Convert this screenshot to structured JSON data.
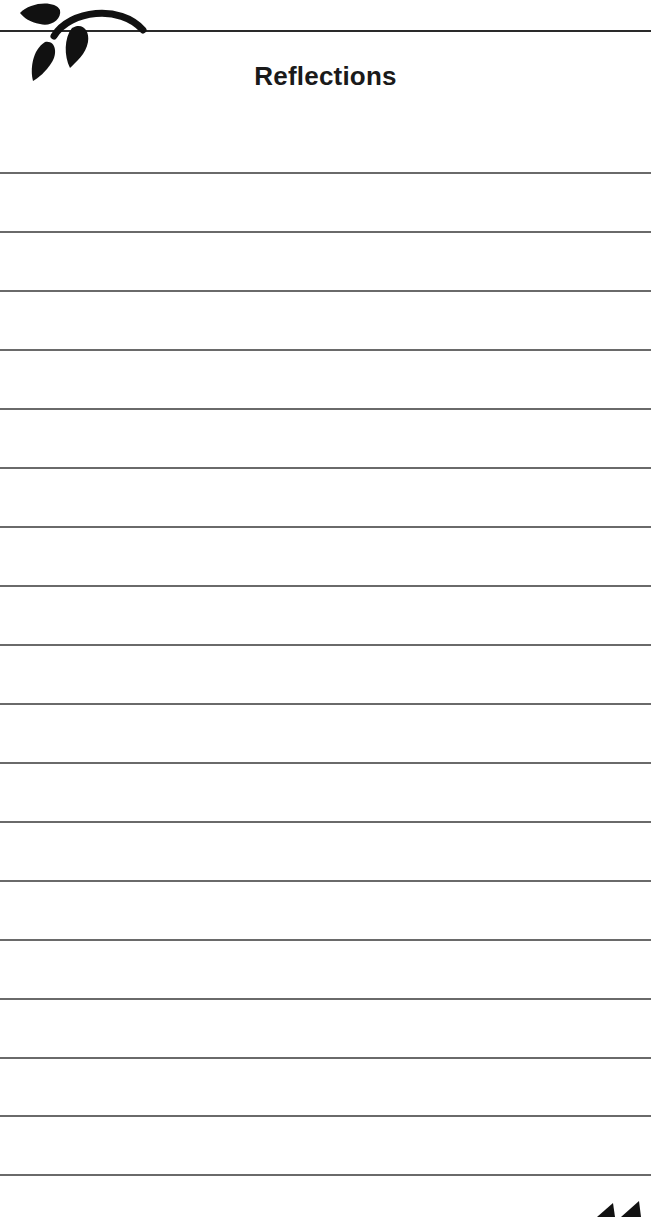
{
  "page": {
    "title": "Reflections",
    "logo_icon": "leaf-branch-icon",
    "page_number_icon": "page-number-partial",
    "ruled_lines": [
      {
        "y": 172
      },
      {
        "y": 231
      },
      {
        "y": 290
      },
      {
        "y": 349
      },
      {
        "y": 408
      },
      {
        "y": 467
      },
      {
        "y": 526
      },
      {
        "y": 585
      },
      {
        "y": 644
      },
      {
        "y": 703
      },
      {
        "y": 762
      },
      {
        "y": 821
      },
      {
        "y": 880
      },
      {
        "y": 939
      },
      {
        "y": 998
      },
      {
        "y": 1057
      },
      {
        "y": 1115
      },
      {
        "y": 1174
      }
    ],
    "colors": {
      "ink": "#1a1a1a",
      "rule": "#6a6a6a"
    }
  }
}
